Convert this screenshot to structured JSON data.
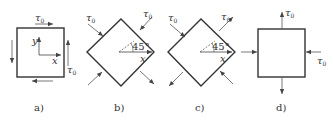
{
  "figure": {
    "panels": [
      {
        "id": "a",
        "caption": "a)",
        "shape": "square",
        "stress_label": "τ",
        "stress_sub": "0",
        "axes": {
          "x": "x",
          "y": "y"
        }
      },
      {
        "id": "b",
        "caption": "b)",
        "shape": "rotated-square-45",
        "stress_label": "τ",
        "stress_sub": "0",
        "angle": "45°",
        "axis": "x"
      },
      {
        "id": "c",
        "caption": "c)",
        "shape": "rotated-square-45",
        "stress_label": "τ",
        "stress_sub": "0",
        "angle": "45°",
        "axis": "x"
      },
      {
        "id": "d",
        "caption": "d)",
        "shape": "square",
        "stress_label": "τ",
        "stress_sub": "0"
      }
    ],
    "colors": {
      "line": "#333333",
      "arrow": "#555555"
    }
  }
}
